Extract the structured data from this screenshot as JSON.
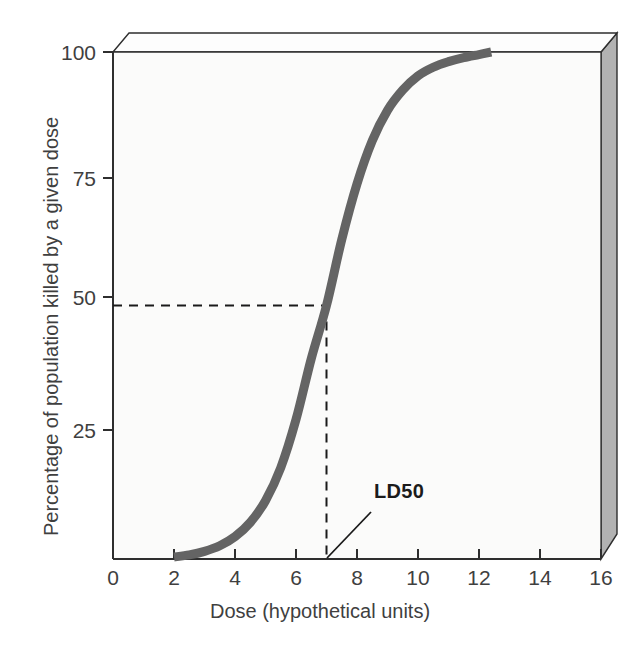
{
  "chart_data": {
    "type": "line",
    "title": "",
    "subtitle": "",
    "xlabel": "Dose (hypothetical units)",
    "ylabel": "Percentage of population killed by a given dose",
    "xlim": [
      0,
      16
    ],
    "ylim": [
      0,
      100
    ],
    "xticks": [
      0,
      2,
      4,
      6,
      8,
      10,
      12,
      14,
      16
    ],
    "xtick_labels": [
      "0",
      "2",
      "4",
      "6",
      "8",
      "10",
      "12",
      "14",
      "16"
    ],
    "yticks": [
      0,
      25,
      50,
      75,
      100
    ],
    "ytick_labels": [
      "0",
      "25",
      "50",
      "75",
      "100"
    ],
    "grid": false,
    "legend": null,
    "series": [
      {
        "name": "Dose-response curve",
        "color": "#646464",
        "x": [
          2.0,
          2.5,
          3.0,
          3.5,
          4.0,
          4.5,
          5.0,
          5.5,
          6.0,
          6.5,
          7.0,
          7.5,
          8.0,
          8.5,
          9.0,
          9.5,
          10.0,
          10.5,
          11.0,
          11.5,
          12.0,
          12.4
        ],
        "y": [
          0.4,
          0.8,
          1.5,
          2.6,
          4.4,
          7.2,
          11.5,
          18.0,
          27.5,
          39.5,
          50.0,
          63.0,
          74.0,
          82.5,
          88.5,
          92.5,
          95.3,
          97.0,
          98.1,
          98.9,
          99.5,
          100.0
        ]
      }
    ],
    "annotations": [
      {
        "name": "ld50-label",
        "text": "LD50",
        "x": 7.0,
        "y": 50,
        "note": "Median lethal dose marker; guide lines drawn from y=50 to curve and down to x=7"
      }
    ],
    "guide_lines": [
      {
        "name": "ld50-horizontal-guide",
        "style": "dashed",
        "from": [
          0,
          50
        ],
        "to": [
          7.0,
          50
        ]
      },
      {
        "name": "ld50-vertical-guide",
        "style": "dashed",
        "from": [
          7.0,
          50
        ],
        "to": [
          7.0,
          0
        ]
      }
    ],
    "colors": {
      "curve": "#646464",
      "axis": "#2e2e2e",
      "guide": "#1a1a1a",
      "panel_side": "#b2b2b2",
      "panel_top": "#fdfdfd",
      "plot_background": "#fbfbfa",
      "text": "#3f3f3f"
    }
  }
}
